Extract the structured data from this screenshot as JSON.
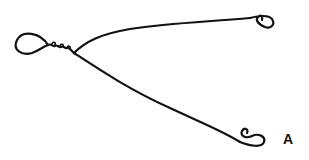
{
  "figure": {
    "label": "A",
    "stroke_color": "#111111",
    "background": "#ffffff",
    "parts": [
      "eye-loop",
      "twisted-neck",
      "upper-arm",
      "lower-arm",
      "upper-end-curl",
      "lower-end-curl"
    ]
  }
}
